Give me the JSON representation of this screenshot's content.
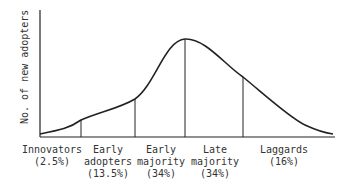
{
  "diagram": {
    "y_axis_label": "No. of new adopters",
    "colors": {
      "line": "#222222",
      "text": "#333333",
      "background": "#ffffff"
    },
    "categories": [
      {
        "name_line1": "Innovators",
        "name_line2": "",
        "percent": "(2.5%)"
      },
      {
        "name_line1": "Early",
        "name_line2": "adopters",
        "percent": "(13.5%)"
      },
      {
        "name_line1": "Early",
        "name_line2": "majority",
        "percent": "(34%)"
      },
      {
        "name_line1": "Late",
        "name_line2": "majority",
        "percent": "(34%)"
      },
      {
        "name_line1": "Laggards",
        "name_line2": "",
        "percent": "(16%)"
      }
    ]
  }
}
